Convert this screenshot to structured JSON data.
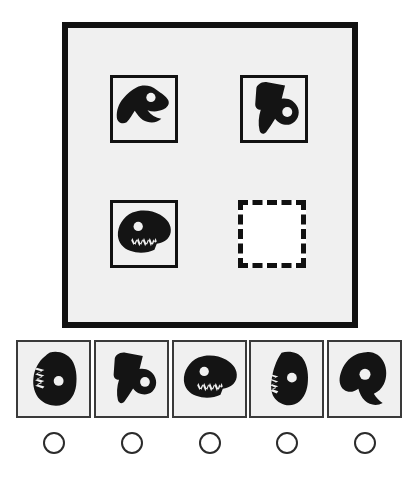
{
  "puzzle": {
    "type": "visual-analogy-matrix",
    "title": "Abstract shape matrix reasoning task",
    "grid": {
      "rows": 2,
      "columns": 2,
      "cells": [
        {
          "position": "row1-col1",
          "state": "filled",
          "shape_name": "black-blob-dinosaur-head-right",
          "description": "Solid black irregular blob resembling a dinosaur head facing right with one round white eye hole and a notched open jaw at lower right"
        },
        {
          "position": "row1-col2",
          "state": "filled",
          "shape_name": "black-blob-two-pronged-downward",
          "description": "Solid black irregular blob with two downward prongs and one round white eye hole at lower right"
        },
        {
          "position": "row2-col1",
          "state": "filled",
          "shape_name": "black-blob-dinosaur-head-toothed",
          "description": "Solid black dinosaur head facing right with round white eye hole and a row of white jagged teeth along the lower jaw"
        },
        {
          "position": "row2-col2",
          "state": "empty",
          "shape_name": "empty-answer-slot",
          "description": "Empty dashed-outline square marking the missing element to be selected"
        }
      ]
    },
    "options": {
      "count": 5,
      "selected_index": null,
      "items": [
        {
          "index": 0,
          "label": "Option 1",
          "shape_name": "black-blob-toothed-left-round-right",
          "description": "Rounded black blob with white jagged teeth on the left side and a round white eye hole at center right"
        },
        {
          "index": 1,
          "label": "Option 2",
          "shape_name": "black-blob-two-pronged-downward",
          "description": "Solid black blob with two downward prongs and a round white eye hole at lower right"
        },
        {
          "index": 2,
          "label": "Option 3",
          "shape_name": "black-blob-dinosaur-head-toothed",
          "description": "Black dinosaur head facing right with round white eye hole and jagged white teeth along the jaw"
        },
        {
          "index": 3,
          "label": "Option 4",
          "shape_name": "black-blob-toothed-left-eye-center",
          "description": "Rounded black blob with small white jagged teeth on the left edge and a round white eye hole near the center"
        },
        {
          "index": 4,
          "label": "Option 5",
          "shape_name": "black-blob-dinosaur-head-left",
          "description": "Black blob resembling a dinosaur head facing left with a round white eye hole and a protruding lower snout"
        }
      ]
    },
    "radios": [
      {
        "index": 0,
        "checked": false,
        "label": "Select option 1"
      },
      {
        "index": 1,
        "checked": false,
        "label": "Select option 2"
      },
      {
        "index": 2,
        "checked": false,
        "label": "Select option 3"
      },
      {
        "index": 3,
        "checked": false,
        "label": "Select option 4"
      },
      {
        "index": 4,
        "checked": false,
        "label": "Select option 5"
      }
    ]
  },
  "colors": {
    "page_background": "#ffffff",
    "panel_background": "#f0f0f0",
    "shape_fill": "#141414",
    "frame_stroke": "#111111",
    "tile_stroke": "#3a3a3a",
    "radio_stroke": "#2b2b2b",
    "empty_slot_fill": "#ffffff"
  }
}
